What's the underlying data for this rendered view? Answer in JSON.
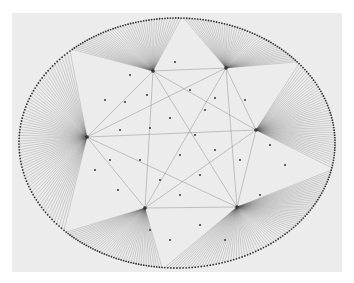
{
  "figure": {
    "background_color": "#ffffff",
    "panel_color": "#ececec",
    "edge_color": "#555555",
    "node_color": "#333333"
  },
  "layout": {
    "ellipse_center": [
      177,
      143
    ],
    "ellipse_radii": [
      158,
      125
    ],
    "perimeter_node_count": 330
  },
  "hubs": [
    {
      "id": "hub-left",
      "x": 87,
      "y": 137,
      "arc_start_deg": 135,
      "arc_end_deg": 228,
      "spokes": 70
    },
    {
      "id": "hub-top-center",
      "x": 153,
      "y": 71,
      "arc_start_deg": 228,
      "arc_end_deg": 272,
      "spokes": 45
    },
    {
      "id": "hub-top-right",
      "x": 226,
      "y": 68,
      "arc_start_deg": 272,
      "arc_end_deg": 320,
      "spokes": 48
    },
    {
      "id": "hub-right",
      "x": 256,
      "y": 130,
      "arc_start_deg": 320,
      "arc_end_deg": 372,
      "spokes": 45
    },
    {
      "id": "hub-bottom-right",
      "x": 237,
      "y": 207,
      "arc_start_deg": 12,
      "arc_end_deg": 95,
      "spokes": 75
    },
    {
      "id": "hub-bottom-left",
      "x": 145,
      "y": 208,
      "arc_start_deg": 95,
      "arc_end_deg": 135,
      "spokes": 42
    }
  ],
  "inner_nodes": [
    [
      125,
      102
    ],
    [
      147,
      95
    ],
    [
      190,
      90
    ],
    [
      205,
      110
    ],
    [
      170,
      118
    ],
    [
      120,
      130
    ],
    [
      150,
      128
    ],
    [
      195,
      135
    ],
    [
      140,
      160
    ],
    [
      180,
      155
    ],
    [
      215,
      150
    ],
    [
      110,
      160
    ],
    [
      160,
      180
    ],
    [
      200,
      175
    ],
    [
      240,
      160
    ],
    [
      118,
      190
    ],
    [
      180,
      195
    ],
    [
      200,
      225
    ],
    [
      170,
      240
    ],
    [
      215,
      98
    ],
    [
      245,
      100
    ],
    [
      270,
      145
    ],
    [
      285,
      165
    ],
    [
      130,
      75
    ],
    [
      175,
      62
    ],
    [
      105,
      100
    ],
    [
      260,
      195
    ],
    [
      150,
      230
    ],
    [
      225,
      240
    ],
    [
      95,
      170
    ]
  ],
  "cross_edge_count": 160
}
